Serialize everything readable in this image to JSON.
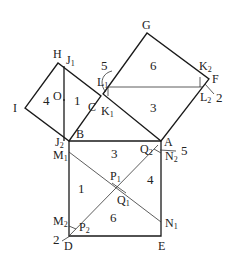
{
  "diagram": {
    "vertex_labels": {
      "H": "H",
      "J1": "J1",
      "I": "I",
      "O": "O",
      "C": "C",
      "L1": "L1",
      "K1": "K1",
      "G": "G",
      "K2": "K2",
      "F": "F",
      "L2": "L2",
      "B": "B",
      "A": "A",
      "J2": "J2",
      "M1": "M1",
      "Q2": "Q2",
      "N2": "N2",
      "P1": "P1",
      "Q1": "Q1",
      "M2": "M2",
      "P2": "P2",
      "N1": "N1",
      "D": "D",
      "E": "E"
    },
    "piece_numbers": {
      "left_square_left": "4",
      "left_square_right": "1",
      "top_square_upper": "6",
      "top_square_lower": "3",
      "top_corner_L1": "5",
      "top_corner_F": "2",
      "bottom_square_top": "3",
      "bottom_square_left": "1",
      "bottom_square_right": "4",
      "bottom_square_bottom": "6",
      "bottom_corner_A": "5",
      "bottom_corner_D": "2"
    }
  }
}
